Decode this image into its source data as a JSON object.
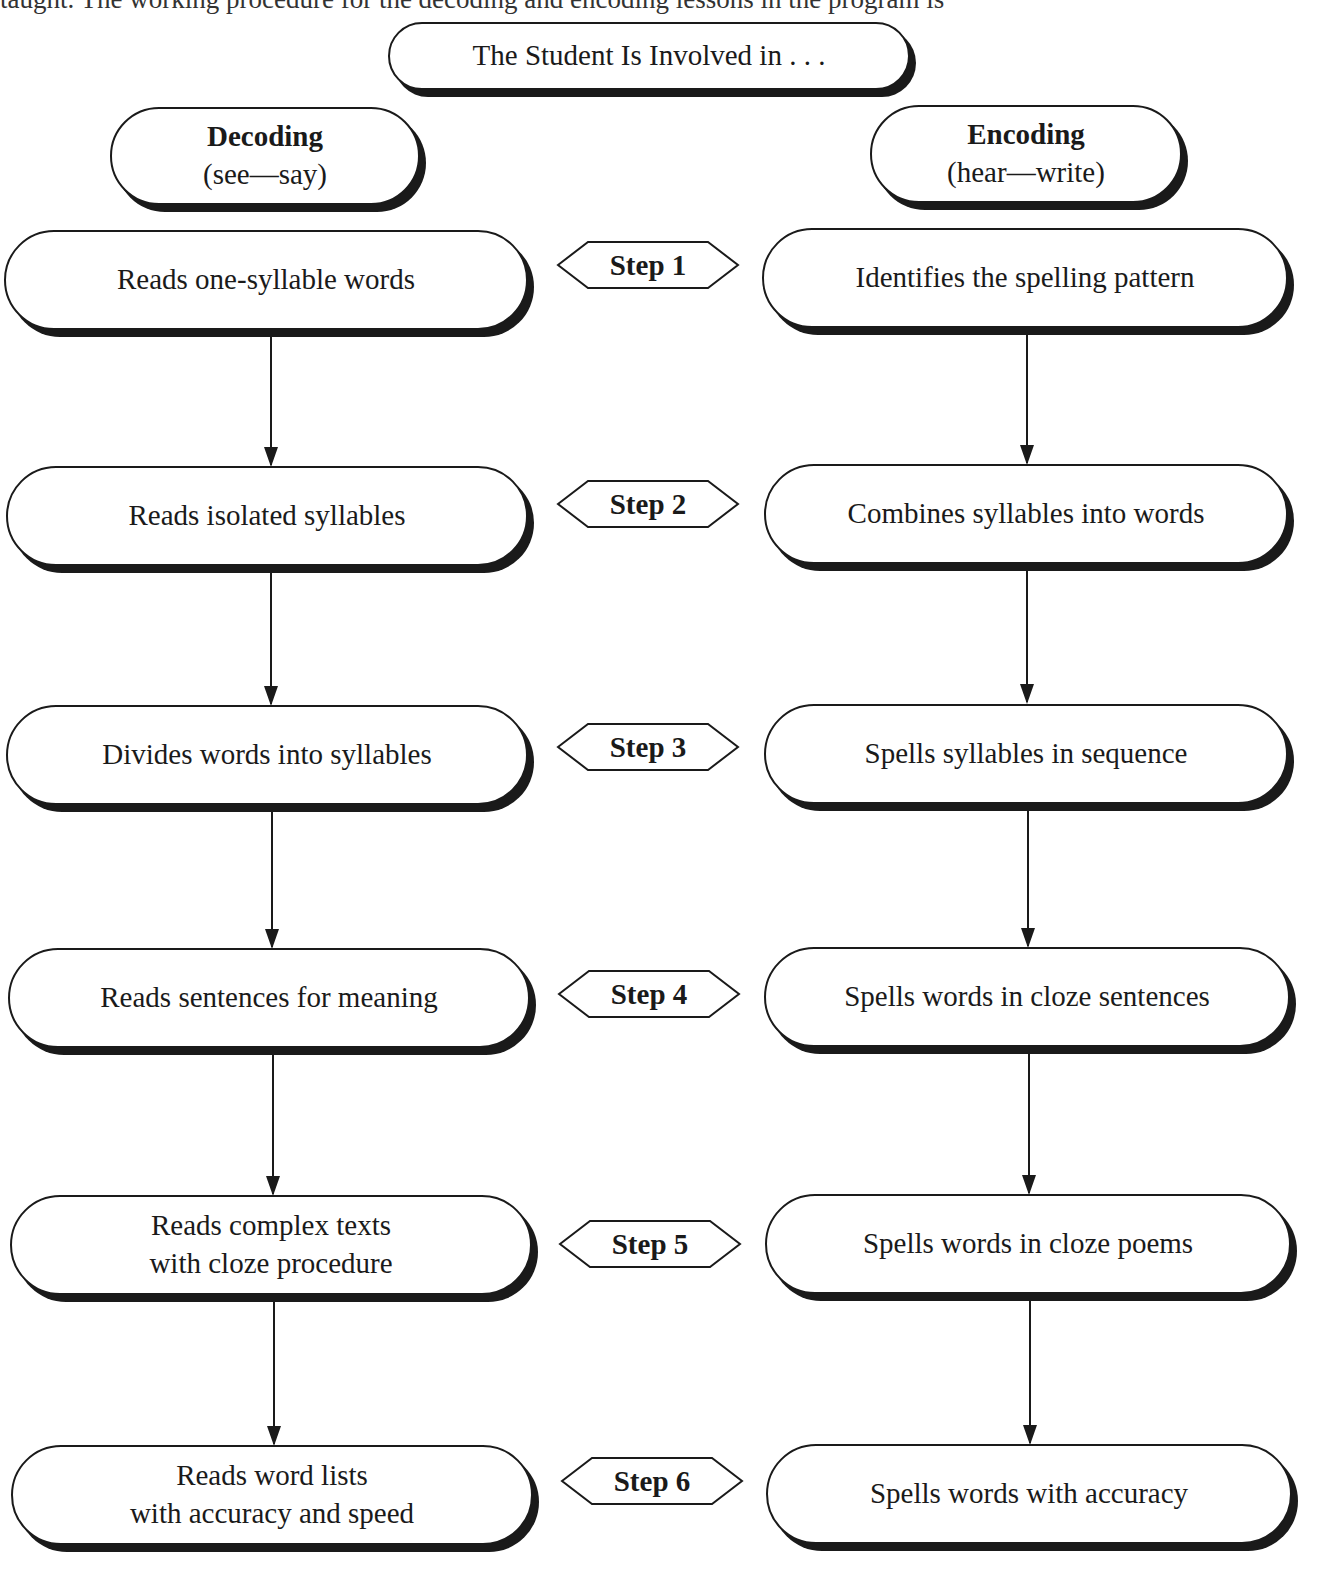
{
  "page": {
    "cut_off_text": "taught. The working procedure for the decoding and encoding lessons in the program is"
  },
  "diagram": {
    "title": "The Student Is Involved in . . .",
    "columns": {
      "left": {
        "heading": "Decoding",
        "subheading": "(see—say)"
      },
      "right": {
        "heading": "Encoding",
        "subheading": "(hear—write)"
      }
    },
    "steps": [
      {
        "label": "Step 1",
        "decoding": [
          "Reads one-syllable words"
        ],
        "encoding": [
          "Identifies the spelling pattern"
        ]
      },
      {
        "label": "Step 2",
        "decoding": [
          "Reads isolated syllables"
        ],
        "encoding": [
          "Combines syllables into words"
        ]
      },
      {
        "label": "Step 3",
        "decoding": [
          "Divides words into syllables"
        ],
        "encoding": [
          "Spells syllables in sequence"
        ]
      },
      {
        "label": "Step 4",
        "decoding": [
          "Reads sentences for meaning"
        ],
        "encoding": [
          "Spells words in cloze sentences"
        ]
      },
      {
        "label": "Step 5",
        "decoding": [
          "Reads complex texts",
          "with cloze procedure"
        ],
        "encoding": [
          "Spells words in cloze poems"
        ]
      },
      {
        "label": "Step 6",
        "decoding": [
          "Reads word lists",
          "with accuracy and speed"
        ],
        "encoding": [
          "Spells words with accuracy"
        ]
      }
    ],
    "colors": {
      "ink": "#1a1a1a",
      "background": "#ffffff"
    }
  }
}
